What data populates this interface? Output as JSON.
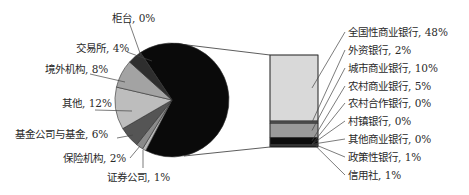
{
  "chart_data": {
    "type": "pie-of-bar",
    "title": "",
    "pie": {
      "center": [
        172,
        100
      ],
      "radius": 57,
      "start_angle_deg": -123.7,
      "slices": [
        {
          "label": "银行业金融机构合计",
          "value": 67,
          "color": "#0a0a0a",
          "expanded": true
        },
        {
          "label": "证券公司",
          "value": 1,
          "color": "#b8b8b8"
        },
        {
          "label": "保险机构",
          "value": 2,
          "color": "#8a8a8a"
        },
        {
          "label": "基金公司与基金",
          "value": 6,
          "color": "#555555"
        },
        {
          "label": "其他",
          "value": 12,
          "color": "#bdbdbd"
        },
        {
          "label": "境外机构",
          "value": 8,
          "color": "#a3a3a3"
        },
        {
          "label": "交易所",
          "value": 4,
          "color": "#2e2e2e"
        },
        {
          "label": "柜台",
          "value": 0,
          "color": "#dddddd"
        }
      ]
    },
    "bar": {
      "x": 270,
      "y": 55,
      "width": 48,
      "height": 92,
      "segments": [
        {
          "label": "全国性商业银行",
          "value": 48,
          "color": "#d9d9d9"
        },
        {
          "label": "外资银行",
          "value": 2,
          "color": "#4a4a4a"
        },
        {
          "label": "城市商业银行",
          "value": 10,
          "color": "#9a9a9a"
        },
        {
          "label": "农村商业银行",
          "value": 5,
          "color": "#0d0d0d"
        },
        {
          "label": "农村合作银行",
          "value": 0,
          "color": "#777777"
        },
        {
          "label": "村镇银行",
          "value": 0,
          "color": "#666666"
        },
        {
          "label": "其他商业银行",
          "value": 0,
          "color": "#555555"
        },
        {
          "label": "政策性银行",
          "value": 1,
          "color": "#1a1a1a"
        },
        {
          "label": "信用社",
          "value": 1,
          "color": "#111111"
        }
      ]
    },
    "left_labels": [
      {
        "text": "柜台, 0%",
        "x": 112,
        "y": 12,
        "anchor": [
          141,
          56
        ],
        "from": [
          129,
          22
        ]
      },
      {
        "text": "交易所, 4%",
        "x": 76,
        "y": 42,
        "anchor": [
          152,
          61
        ],
        "from": [
          127,
          52
        ]
      },
      {
        "text": "境外机构, 8%",
        "x": 45,
        "y": 63,
        "anchor": [
          125,
          82
        ],
        "from": [
          90,
          74
        ]
      },
      {
        "text": "其他, 12%",
        "x": 62,
        "y": 97,
        "anchor": [
          132,
          111
        ],
        "from": [
          95,
          110
        ]
      },
      {
        "text": "基金公司与基金, 6%",
        "x": 15,
        "y": 128,
        "anchor": [
          133,
          135
        ],
        "from": [
          117,
          138
        ]
      },
      {
        "text": "保险机构, 2%",
        "x": 63,
        "y": 152,
        "anchor": [
          140,
          146
        ],
        "from": [
          130,
          158
        ]
      },
      {
        "text": "证券公司, 1%",
        "x": 107,
        "y": 171,
        "anchor": [
          143,
          150
        ],
        "from": [
          143,
          168
        ]
      }
    ],
    "right_labels": [
      {
        "text": "全国性商业银行, 48%",
        "x": 348,
        "y": 26
      },
      {
        "text": "外资银行, 2%",
        "x": 348,
        "y": 44
      },
      {
        "text": "城市商业银行, 10%",
        "x": 348,
        "y": 62
      },
      {
        "text": "农村商业银行, 5%",
        "x": 348,
        "y": 80
      },
      {
        "text": "农村合作银行, 0%",
        "x": 348,
        "y": 97
      },
      {
        "text": "村镇银行, 0%",
        "x": 348,
        "y": 115
      },
      {
        "text": "其他商业银行, 0%",
        "x": 348,
        "y": 133
      },
      {
        "text": "政策性银行, 1%",
        "x": 348,
        "y": 151
      },
      {
        "text": "信用社, 1%",
        "x": 348,
        "y": 169
      }
    ],
    "legend": "none",
    "grid": false
  }
}
